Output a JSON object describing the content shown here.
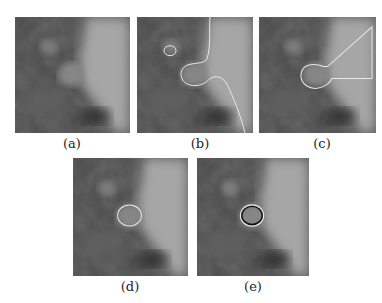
{
  "figure": {
    "panels": [
      {
        "id": "a",
        "caption": "(a)",
        "description": "original grayscale image patch"
      },
      {
        "id": "b",
        "caption": "(b)",
        "description": "segmentation contour leaking into bright region"
      },
      {
        "id": "c",
        "caption": "(c)",
        "description": "contour with wedge-shaped extension"
      },
      {
        "id": "d",
        "caption": "(d)",
        "description": "contour around circular nodule"
      },
      {
        "id": "e",
        "caption": "(e)",
        "description": "final contour with dark outline around nodule"
      }
    ]
  },
  "colors": {
    "dark_tissue": "#3c3c3c",
    "mid_tissue": "#6a6a6a",
    "bright_region": "#a8a8a8",
    "contour_light": "#e8e8e8",
    "contour_dark": "#111111"
  }
}
